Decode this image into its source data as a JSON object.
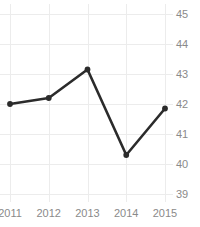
{
  "chart_data": {
    "type": "line",
    "title": "Freedom Trend",
    "xlabel": "",
    "ylabel": "",
    "categories": [
      "2011",
      "2012",
      "2013",
      "2014",
      "2015"
    ],
    "x": [
      2011,
      2012,
      2013,
      2014,
      2015
    ],
    "values": [
      42.0,
      42.2,
      43.15,
      40.3,
      41.85
    ],
    "series": [
      {
        "name": "Freedom Trend",
        "values": [
          42.0,
          42.2,
          43.15,
          40.3,
          41.85
        ],
        "color": "#2b2b2b",
        "marker": "circle"
      }
    ],
    "ylim": [
      39,
      45
    ],
    "yticks": [
      39,
      40,
      41,
      42,
      43,
      44,
      45
    ],
    "ytick_labels": [
      "39",
      "40",
      "41",
      "42",
      "43",
      "44",
      "45"
    ],
    "xticks": [
      2011,
      2012,
      2013,
      2014,
      2015
    ],
    "xtick_labels": [
      "2011",
      "2012",
      "2013",
      "2014",
      "2015"
    ],
    "grid": true,
    "grid_color": "#ececec",
    "y_axis_position": "right",
    "legend": false,
    "legend_position": "none",
    "title_clipped": true,
    "tick_label_color": "#8a8a8a",
    "background": "#ffffff"
  }
}
